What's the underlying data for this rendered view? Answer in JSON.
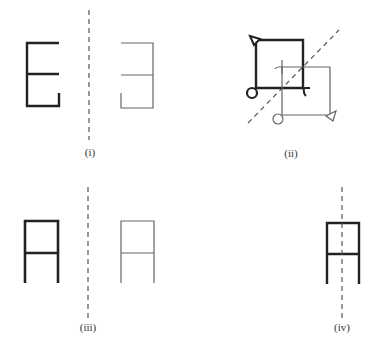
{
  "figure": {
    "colors": {
      "object_stroke": "#222222",
      "image_stroke": "#666666",
      "axis_stroke": "#555555",
      "background": "#ffffff"
    },
    "panels": [
      {
        "id": "i",
        "label": "(i)",
        "content": "Letter E and its mirror image across a vertical dashed line"
      },
      {
        "id": "ii",
        "label": "(ii)",
        "content": "Thick square with triangle, circle and hook reflected across a diagonal dashed line into thin square"
      },
      {
        "id": "iii",
        "label": "(iii)",
        "content": "Letter A shape and its mirror image across a vertical dashed line"
      },
      {
        "id": "iv",
        "label": "(iv)",
        "content": "Letter A shape with vertical dashed line of symmetry through its center"
      }
    ]
  }
}
